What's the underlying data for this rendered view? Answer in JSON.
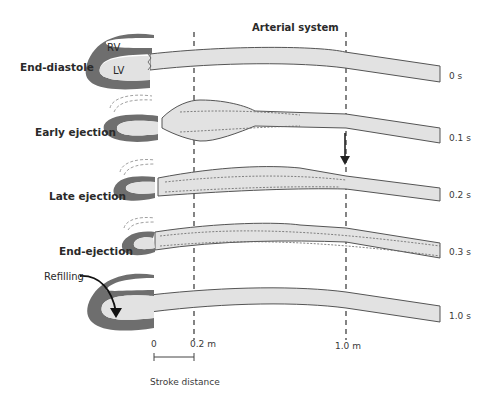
{
  "title": "Arterial system",
  "stages": [
    {
      "label": "End-diastole",
      "time": "0 s"
    },
    {
      "label": "Early ejection",
      "time": "0.1 s"
    },
    {
      "label": "Late ejection",
      "time": "0.2 s"
    },
    {
      "label": "End-ejection",
      "time": "0.3 s"
    },
    {
      "label": "Refilling",
      "time": "1.0 s"
    }
  ],
  "chambers": {
    "rv": "RV",
    "lv": "LV"
  },
  "markers": {
    "zero": "0",
    "m02": "0.2 m",
    "m10": "1.0 m"
  },
  "scale_label": "Stroke distance",
  "colors": {
    "myocardium": "#6e6e6e",
    "blood": "#e2e2e2",
    "outline": "#555555"
  }
}
